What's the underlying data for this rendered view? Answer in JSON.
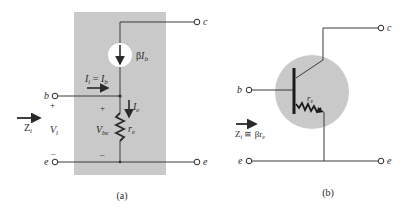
{
  "figure_a": {
    "caption": "(a)",
    "box_color": "#c8c8c8",
    "terminals": {
      "b": "b",
      "c": "c",
      "e_left": "e",
      "e_right": "e"
    },
    "current_source_label_beta": "β",
    "current_source_label_I": "I",
    "current_source_label_sub": "b",
    "input_current_lhs": "I",
    "input_current_lhs_sub": "i",
    "input_current_eq": " = ",
    "input_current_rhs": "I",
    "input_current_rhs_sub": "b",
    "emitter_current": "I",
    "emitter_current_sub": "e",
    "resistor_label": "r",
    "resistor_label_sub": "e",
    "vbe_label": "V",
    "vbe_label_sub": "be",
    "vi_label": "V",
    "vi_label_sub": "i",
    "zi_label": "Z",
    "zi_label_sub": "i",
    "plus": "+",
    "minus": "–"
  },
  "figure_b": {
    "caption": "(b)",
    "circle_color": "#c8c8c8",
    "terminals": {
      "b": "b",
      "c": "c",
      "e_left": "e",
      "e_right": "e"
    },
    "resistor_label": "r",
    "resistor_label_sub": "e",
    "zi_label": "Z",
    "zi_label_sub": "i",
    "zi_eq": " ≅ βr",
    "zi_eq_sub": "e"
  }
}
